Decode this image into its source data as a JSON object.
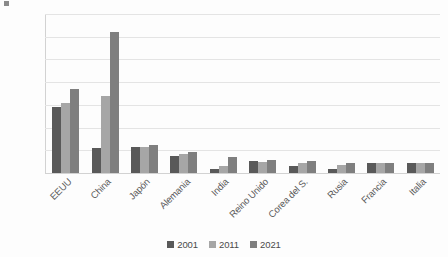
{
  "chart_data": {
    "type": "bar",
    "title": "",
    "subtitle": "",
    "xlabel": "",
    "ylabel": "",
    "ylim": [
      0,
      7000
    ],
    "ytick_step": 1000,
    "ytick_labels": [
      "7.000",
      "6.000",
      "5.000",
      "4.000",
      "3.000",
      "2.000",
      "1.000",
      "0"
    ],
    "ytick_values": [
      7000,
      6000,
      5000,
      4000,
      3000,
      2000,
      1000,
      0
    ],
    "grid": true,
    "legend_position": "bottom",
    "categories": [
      "EEUU",
      "China",
      "Japón",
      "Alemania",
      "India",
      "Reino Unido",
      "Corea del S.",
      "Rusia",
      "Francia",
      "Italia"
    ],
    "series": [
      {
        "name": "2001",
        "color": "#595959",
        "values": [
          2900,
          1100,
          1150,
          730,
          160,
          530,
          290,
          190,
          440,
          440
        ]
      },
      {
        "name": "2011",
        "color": "#a6a6a6",
        "values": [
          3100,
          3400,
          1140,
          820,
          320,
          500,
          460,
          360,
          440,
          430
        ]
      },
      {
        "name": "2021",
        "color": "#7f7f7f",
        "values": [
          3700,
          6200,
          1250,
          930,
          700,
          560,
          540,
          450,
          430,
          420
        ]
      }
    ]
  },
  "legend": {
    "items": [
      {
        "label": "2001"
      },
      {
        "label": "2011"
      },
      {
        "label": "2021"
      }
    ]
  }
}
